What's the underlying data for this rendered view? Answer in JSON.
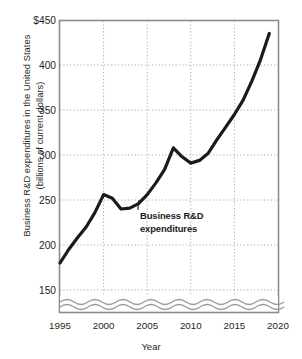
{
  "chart_data": {
    "type": "line",
    "title": "",
    "xlabel": "Year",
    "ylabel_line1": "Business R&D expenditures in the United States",
    "ylabel_line2": "(billions of current dollars)",
    "ylim": [
      150,
      450
    ],
    "xlim": [
      1995,
      2020
    ],
    "grid": true,
    "axis_break": true,
    "legend": "none",
    "line_color": "#1a1a1a",
    "grid_color": "#b0b0b0",
    "frame_color": "#808080",
    "y_ticks": [
      {
        "value": 450,
        "label": "$450"
      },
      {
        "value": 400,
        "label": "400"
      },
      {
        "value": 350,
        "label": "350"
      },
      {
        "value": 300,
        "label": "300"
      },
      {
        "value": 250,
        "label": "250"
      },
      {
        "value": 200,
        "label": "200"
      },
      {
        "value": 150,
        "label": "150"
      }
    ],
    "x_ticks": [
      {
        "value": 1995,
        "label": "1995"
      },
      {
        "value": 2000,
        "label": "2000"
      },
      {
        "value": 2005,
        "label": "2005"
      },
      {
        "value": 2010,
        "label": "2010"
      },
      {
        "value": 2015,
        "label": "2015"
      },
      {
        "value": 2020,
        "label": "2020"
      }
    ],
    "series": [
      {
        "name": "Business R&D expenditures",
        "x": [
          1995,
          1996,
          1997,
          1998,
          1999,
          2000,
          2001,
          2002,
          2003,
          2004,
          2005,
          2006,
          2007,
          2008,
          2009,
          2010,
          2011,
          2012,
          2013,
          2014,
          2015,
          2016,
          2017,
          2018,
          2019
        ],
        "values": [
          180,
          195,
          208,
          220,
          236,
          256,
          252,
          240,
          241,
          246,
          256,
          269,
          284,
          308,
          298,
          291,
          294,
          302,
          317,
          331,
          345,
          361,
          382,
          406,
          435
        ]
      }
    ],
    "annotations": [
      {
        "name": "series-callout",
        "line1": "Business R&D",
        "line2": "expenditures",
        "points_to_x": 2004,
        "points_to_y": 246
      }
    ]
  }
}
